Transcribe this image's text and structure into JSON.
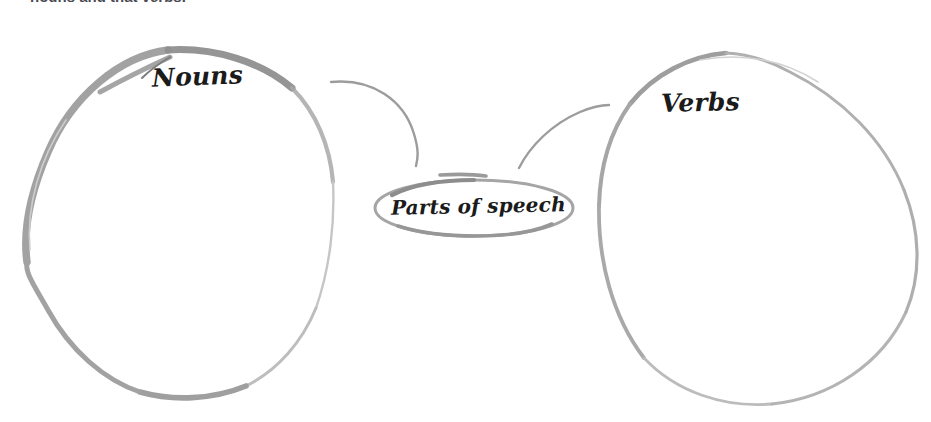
{
  "page": {
    "background_color": "#ffffff",
    "width": 931,
    "height": 422
  },
  "heading": {
    "text": "nouns and that verbs.",
    "clipped": "true"
  },
  "diagram": {
    "type": "concept-map",
    "ink_colors": {
      "heavy_stroke": "#9a9a9a",
      "light_stroke": "#b9b9b9",
      "faint_stroke": "#d4d4d4",
      "label_text": "#1b1b1b"
    },
    "nodes": [
      {
        "id": "nouns",
        "label": "Nouns",
        "shape": "oval",
        "center_x": 176,
        "center_y": 223,
        "radius_x": 154,
        "radius_y": 178
      },
      {
        "id": "parts-of-speech",
        "label": "Parts of speech",
        "shape": "ellipse",
        "center_x": 474,
        "center_y": 208,
        "radius_x": 100,
        "radius_y": 28
      },
      {
        "id": "verbs",
        "label": "Verbs",
        "shape": "oval",
        "center_x": 758,
        "center_y": 228,
        "radius_x": 160,
        "radius_y": 177
      }
    ],
    "connectors": [
      {
        "id": "parts-to-nouns",
        "from": "parts-of-speech",
        "to": "nouns",
        "style": "curved-line"
      },
      {
        "id": "parts-to-verbs",
        "from": "parts-of-speech",
        "to": "verbs",
        "style": "curved-line"
      }
    ]
  }
}
